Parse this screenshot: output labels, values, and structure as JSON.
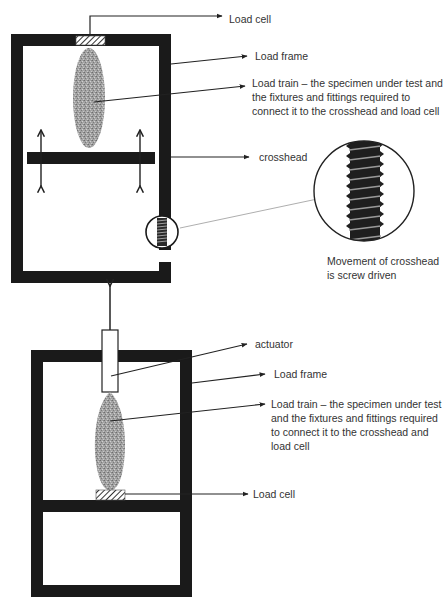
{
  "diagram": {
    "type": "schematic comparison of two universal testing machine configurations",
    "colors": {
      "frame": "#1a1a1a",
      "specimen": "#9a9a9a",
      "text": "#333333",
      "line": "#222222"
    },
    "upper_machine": {
      "labels": {
        "load_cell": "Load cell",
        "load_frame": "Load frame",
        "load_train": "Load train – the specimen under test and the fixtures and fittings required to connect it to the crosshead and load cell",
        "crosshead": "crosshead",
        "screw_note": "Movement of crosshead is screw driven"
      }
    },
    "lower_machine": {
      "labels": {
        "actuator": "actuator",
        "load_frame": "Load frame",
        "load_train": "Load train – the specimen under test and the fixtures and fittings required to connect it to the crosshead and load cell",
        "load_cell": "Load cell"
      }
    }
  }
}
